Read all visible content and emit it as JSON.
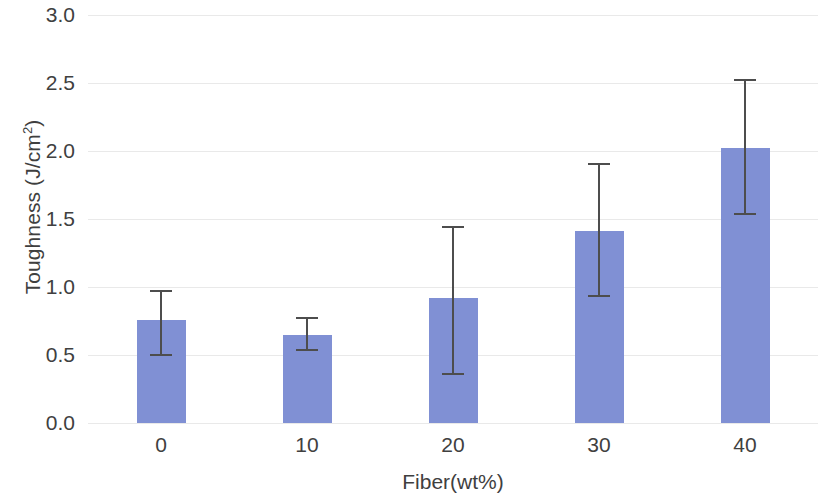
{
  "chart_data": {
    "type": "bar",
    "title": "",
    "xlabel": "Fiber(wt%)",
    "ylabel": "Toughness (J/cm²)",
    "categories": [
      "0",
      "10",
      "20",
      "30",
      "40"
    ],
    "values": [
      0.76,
      0.65,
      0.92,
      1.41,
      2.02
    ],
    "error_upper": [
      0.98,
      0.78,
      1.45,
      1.91,
      2.53
    ],
    "error_lower": [
      0.49,
      0.53,
      0.35,
      0.93,
      1.53
    ],
    "ylim": [
      0.0,
      3.0
    ],
    "ytick_labels": [
      "3.0",
      "2.5",
      "2.0",
      "1.5",
      "1.0",
      "0.5",
      "0.0"
    ],
    "ytick_values": [
      3.0,
      2.5,
      2.0,
      1.5,
      1.0,
      0.5,
      0.0
    ],
    "grid": true,
    "grid_axis": "y",
    "legend": "none",
    "bar_color": "#8090d4",
    "error_color": "#4d4d4d",
    "grid_color": "#e9e9e9"
  },
  "axes": {
    "y_title": "Toughness (J/cm",
    "y_title_sup": "2",
    "y_title_tail": ")",
    "x_title": "Fiber(wt%)"
  }
}
